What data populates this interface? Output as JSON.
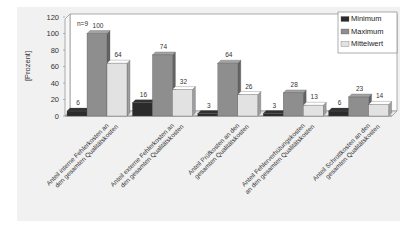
{
  "chart_data": {
    "type": "bar",
    "title": "",
    "annotation": "n=9",
    "xlabel": "",
    "ylabel": "[Prozent]",
    "ylim": [
      0,
      120
    ],
    "yticks": [
      "0",
      "20",
      "40",
      "60",
      "80",
      "100",
      "120"
    ],
    "grid": false,
    "legend_position": "top-right",
    "categories": [
      [
        "Anteil interne Fehlerkosten an",
        "den gesamten Qualitätskosten"
      ],
      [
        "Anteil externe Fehlerkosten an",
        "den gesamten Qualitätskosten"
      ],
      [
        "Anteil Prüfkosten an den",
        "gesamten Qualitätskosten"
      ],
      [
        "Anteil Fehlerverhütungskosten",
        "an den gesamten Qualitätskosten"
      ],
      [
        "Anteil Schrottkosten an den",
        "gesamten Qualitätskosten"
      ]
    ],
    "series": [
      {
        "name": "Minimum",
        "color": "#2b2b2b",
        "values": [
          6,
          16,
          3,
          3,
          6
        ]
      },
      {
        "name": "Maximum",
        "color": "#8e8e8e",
        "values": [
          100,
          74,
          64,
          28,
          23
        ]
      },
      {
        "name": "Mittelwert",
        "color": "#e2e2e2",
        "values": [
          64,
          32,
          26,
          13,
          14
        ]
      }
    ]
  }
}
